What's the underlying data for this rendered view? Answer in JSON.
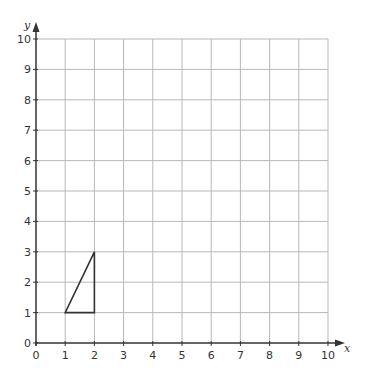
{
  "chart_data": {
    "type": "diagram",
    "title": "",
    "xlabel": "x",
    "ylabel": "y",
    "xlim": [
      0,
      10
    ],
    "ylim": [
      0,
      10
    ],
    "grid": true,
    "x_ticks": [
      "0",
      "1",
      "2",
      "3",
      "4",
      "5",
      "6",
      "7",
      "8",
      "9",
      "10"
    ],
    "y_ticks": [
      "0",
      "1",
      "2",
      "3",
      "4",
      "5",
      "6",
      "7",
      "8",
      "9",
      "10"
    ],
    "shapes": [
      {
        "name": "triangle",
        "vertices": [
          [
            1,
            1
          ],
          [
            2,
            1
          ],
          [
            2,
            3
          ]
        ]
      }
    ]
  },
  "axes": {
    "x_label": "x",
    "y_label": "y"
  },
  "colors": {
    "grid": "#b8b8b8",
    "axis": "#333333",
    "shape": "#333333"
  }
}
